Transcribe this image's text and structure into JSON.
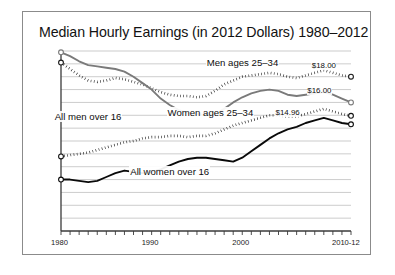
{
  "figure": {
    "title": "Median Hourly Earnings (in 2012 Dollars) 1980–2012",
    "frame_color": "#8b8b8b",
    "background": "#ffffff",
    "caption": ""
  },
  "chart_data": {
    "type": "line",
    "title": "Median Hourly Earnings (in 2012 Dollars) 1980–2012",
    "xlabel": "",
    "ylabel": "",
    "xlim": [
      1980,
      2012
    ],
    "ylim": [
      6,
      20
    ],
    "grid": true,
    "grid_lines_y": [
      6,
      7,
      8,
      9,
      10,
      11,
      12,
      13,
      14,
      15,
      16,
      17,
      18,
      19,
      20
    ],
    "legend_position": "inline-annotations",
    "x_tick_labels": [
      "1980",
      "1990",
      "2000",
      "2010-12"
    ],
    "x_tick_values": [
      1980,
      1990,
      2000,
      2011
    ],
    "x": [
      1980,
      1981,
      1982,
      1983,
      1984,
      1985,
      1986,
      1987,
      1988,
      1989,
      1990,
      1991,
      1992,
      1993,
      1994,
      1995,
      1996,
      1997,
      1998,
      1999,
      2000,
      2001,
      2002,
      2003,
      2004,
      2005,
      2006,
      2007,
      2008,
      2009,
      2010,
      2011,
      2012
    ],
    "series": [
      {
        "name": "Men ages 25–34",
        "style": "dotted",
        "color": "#1a1a1a",
        "marker_endpoints": "open-circle",
        "end_value_label": "$18.00",
        "end_value": 18.0,
        "values": [
          19.1,
          18.6,
          18.1,
          17.7,
          17.6,
          17.7,
          17.9,
          17.8,
          17.6,
          17.4,
          17.1,
          16.8,
          16.6,
          16.5,
          16.5,
          16.4,
          16.5,
          16.9,
          17.4,
          17.7,
          18.0,
          18.1,
          18.2,
          18.3,
          18.2,
          18.0,
          17.9,
          18.1,
          18.3,
          18.5,
          18.3,
          18.1,
          18.0
        ]
      },
      {
        "name": "All men over 16",
        "style": "solid",
        "color": "#7a7a7a",
        "marker_endpoints": "open-circle",
        "end_value_label": "$16.00",
        "end_value": 16.0,
        "values": [
          19.9,
          19.6,
          19.2,
          18.9,
          18.8,
          18.7,
          18.6,
          18.4,
          18.0,
          17.5,
          17.0,
          16.3,
          15.8,
          15.4,
          15.2,
          15.1,
          15.0,
          15.1,
          15.5,
          16.0,
          16.4,
          16.7,
          16.9,
          17.0,
          16.9,
          16.6,
          16.5,
          16.6,
          16.7,
          16.8,
          16.6,
          16.3,
          16.0
        ]
      },
      {
        "name": "Women ages 25–34",
        "style": "dotted",
        "color": "#121212",
        "marker_endpoints": "open-circle",
        "end_value_label": "$14.96",
        "end_value": 14.96,
        "values": [
          11.8,
          11.9,
          12.0,
          12.1,
          12.3,
          12.5,
          12.7,
          12.9,
          13.0,
          13.2,
          13.3,
          13.3,
          13.4,
          13.4,
          13.3,
          13.4,
          13.4,
          13.6,
          13.9,
          14.2,
          14.4,
          14.6,
          14.8,
          15.0,
          15.0,
          14.9,
          14.9,
          15.1,
          15.3,
          15.5,
          15.3,
          15.1,
          14.96
        ]
      },
      {
        "name": "All women over 16",
        "style": "solid",
        "color": "#0a0a0a",
        "marker_endpoints": "open-circle",
        "end_value_label": "",
        "end_value": 14.3,
        "values": [
          10.0,
          10.0,
          9.9,
          9.8,
          9.9,
          10.2,
          10.5,
          10.7,
          10.6,
          10.5,
          10.6,
          10.8,
          11.1,
          11.4,
          11.6,
          11.7,
          11.7,
          11.6,
          11.5,
          11.4,
          11.7,
          12.2,
          12.7,
          13.2,
          13.6,
          13.9,
          14.1,
          14.4,
          14.6,
          14.8,
          14.6,
          14.4,
          14.3
        ]
      }
    ],
    "annotations": [
      {
        "text": "Men ages 25–34",
        "x": 2000.0,
        "y": 19.1
      },
      {
        "text": "All men over 16",
        "x": 1983.0,
        "y": 14.9
      },
      {
        "text": "Women ages 25–34",
        "x": 1996.5,
        "y": 15.2
      },
      {
        "text": "All women over 16",
        "x": 1992.0,
        "y": 10.6
      },
      {
        "text": "$18.00",
        "x": 2009.0,
        "y": 18.9
      },
      {
        "text": "$16.00",
        "x": 2008.5,
        "y": 16.9
      },
      {
        "text": "$14.96",
        "x": 2005.0,
        "y": 15.2
      }
    ]
  }
}
